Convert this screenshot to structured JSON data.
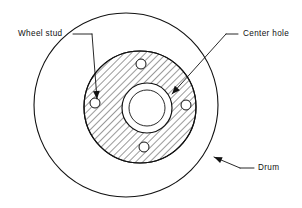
{
  "figure": {
    "background_color": "#ffffff",
    "line_color": "#111111",
    "width": 302,
    "height": 208
  },
  "labels": {
    "wheel_stud": "Wheel  stud",
    "center_hole": "Center  hole",
    "drum": "Drum"
  },
  "parts": {
    "drum": {
      "name": "Drum",
      "shape": "circle",
      "center_x": 126,
      "center_y": 105,
      "radius": 92
    },
    "hub": {
      "name": "Hub flange",
      "shape": "hatched-circle",
      "center_x": 140,
      "center_y": 107,
      "radius": 56,
      "hatch_angle_deg": 45
    },
    "center_hole": {
      "name": "Center hole",
      "shape": "annulus",
      "center_x": 147,
      "center_y": 108,
      "outer_radius": 25,
      "inner_radius": 18
    },
    "wheel_studs": {
      "name": "Wheel stud",
      "count": 4,
      "radius": 5,
      "positions": [
        {
          "cx": 141,
          "cy": 64
        },
        {
          "cx": 95,
          "cy": 103
        },
        {
          "cx": 186,
          "cy": 105
        },
        {
          "cx": 144,
          "cy": 147
        }
      ]
    }
  },
  "leaders": {
    "wheel_stud": {
      "label_anchor_x": 18,
      "label_anchor_y": 34,
      "dash_x1": 73,
      "dash_x2": 92,
      "dash_y": 34,
      "elbow_x": 92,
      "elbow_y": 34,
      "tip_x": 97,
      "tip_y": 99
    },
    "center_hole": {
      "label_anchor_x": 243,
      "label_anchor_y": 34,
      "dash_x1": 226,
      "dash_x2": 238,
      "dash_y": 34,
      "elbow_x": 226,
      "elbow_y": 34,
      "tip_x": 172,
      "tip_y": 94
    },
    "drum": {
      "label_anchor_x": 258,
      "label_anchor_y": 168,
      "dash_x1": 240,
      "dash_x2": 254,
      "dash_y": 168,
      "tip_x": 214,
      "tip_y": 157
    }
  }
}
